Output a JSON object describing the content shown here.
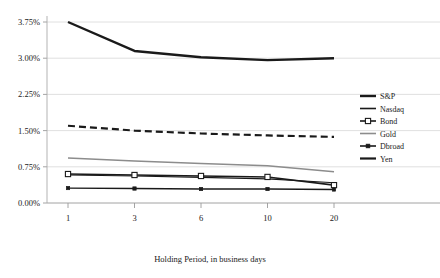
{
  "chart_data": {
    "type": "line",
    "title": "",
    "xlabel": "Holding Period, in business days",
    "ylabel": "",
    "categories": [
      "1",
      "3",
      "6",
      "10",
      "20"
    ],
    "x_tick_labels": [
      "1",
      "3",
      "6",
      "10",
      "20"
    ],
    "y_tick_labels": [
      "0.00%",
      "0.75%",
      "1.50%",
      "2.25%",
      "3.00%",
      "3.75%"
    ],
    "ylim": [
      0.0,
      3.75
    ],
    "y_tick_values": [
      0.0,
      0.75,
      1.5,
      2.25,
      3.0,
      3.75
    ],
    "grid": true,
    "legend_position": "right",
    "series": [
      {
        "name": "S&P",
        "values": [
          3.75,
          3.15,
          3.02,
          2.96,
          3.0
        ],
        "color": "#1a1a1a",
        "style": "solid",
        "width": 2.4,
        "marker": "none"
      },
      {
        "name": "Nasdaq",
        "values": [
          0.58,
          0.56,
          0.53,
          0.5,
          0.42
        ],
        "color": "#1a1a1a",
        "style": "solid",
        "width": 1.1,
        "marker": "none"
      },
      {
        "name": "Bond",
        "values": [
          0.6,
          0.58,
          0.56,
          0.54,
          0.37
        ],
        "color": "#1a1a1a",
        "style": "solid",
        "width": 1.6,
        "marker": "open-square"
      },
      {
        "name": "Gold",
        "values": [
          0.93,
          0.87,
          0.82,
          0.77,
          0.65
        ],
        "color": "#8c8c8c",
        "style": "solid",
        "width": 1.5,
        "marker": "none"
      },
      {
        "name": "Dbroad",
        "values": [
          0.31,
          0.3,
          0.29,
          0.29,
          0.28
        ],
        "color": "#1a1a1a",
        "style": "solid",
        "width": 1.3,
        "marker": "solid-square"
      },
      {
        "name": "Yen",
        "values": [
          1.6,
          1.5,
          1.44,
          1.4,
          1.37
        ],
        "color": "#1a1a1a",
        "style": "dashed",
        "width": 2.2,
        "marker": "none"
      }
    ]
  },
  "legend": {
    "items": [
      {
        "label": "S&P",
        "swatch": "thick-line"
      },
      {
        "label": "Nasdaq",
        "swatch": "thick-line"
      },
      {
        "label": "Bond",
        "swatch": "line-open-square"
      },
      {
        "label": "Gold",
        "swatch": "gray-line"
      },
      {
        "label": "Dbroad",
        "swatch": "line-solid-square"
      },
      {
        "label": "Yen",
        "swatch": "thick-line"
      }
    ]
  },
  "colors": {
    "grid": "#d8d8d8",
    "axis": "#aaaaaa",
    "text": "#1a1a1a",
    "gold_series": "#8c8c8c"
  }
}
